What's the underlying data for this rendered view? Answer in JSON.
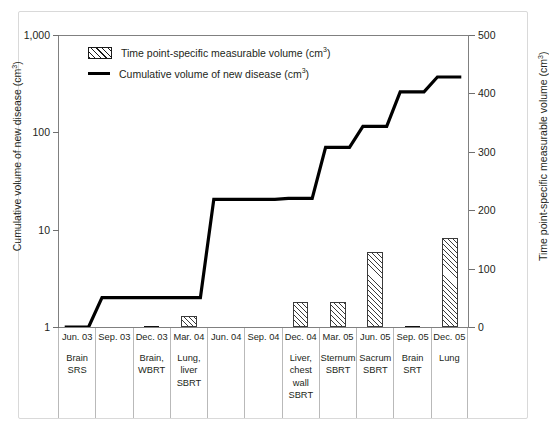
{
  "figure": {
    "legend": [
      {
        "key": "bar",
        "label": "Time point-specific measurable volume (cm",
        "sup": "3",
        "tail": ")"
      },
      {
        "key": "line",
        "label": "Cumulative volume of new disease (cm",
        "sup": "3",
        "tail": ")"
      }
    ],
    "left_axis_title": "Cumulative volume of new disease (cm",
    "left_axis_title_sup": "3",
    "left_axis_title_tail": ")",
    "right_axis_title": "Time point-specific measurable volume (cm",
    "right_axis_title_sup": "3",
    "right_axis_title_tail": ")",
    "left_ticks": [
      "1,000",
      "100",
      "10",
      "1"
    ],
    "right_ticks": [
      "500",
      "400",
      "300",
      "200",
      "100",
      "0"
    ]
  },
  "chart_data": {
    "type": "bar",
    "title": "",
    "xlabel": "",
    "ylabel": "Cumulative volume of new disease (cm3)",
    "y2label": "Time point-specific measurable volume (cm3)",
    "yscale": "log",
    "ylim": [
      1,
      1000
    ],
    "y2lim": [
      0,
      500
    ],
    "grid": false,
    "legend_position": "top-left",
    "categories": [
      "Jun. 03",
      "Sep. 03",
      "Dec. 03",
      "Mar. 04",
      "Jun. 04",
      "Sep. 04",
      "Dec. 04",
      "Mar. 05",
      "Jun. 05",
      "Sep. 05",
      "Dec. 05"
    ],
    "category_labels": [
      {
        "date": "Jun. 03",
        "site": "Brain\nSRS"
      },
      {
        "date": "Sep. 03",
        "site": ""
      },
      {
        "date": "Dec. 03",
        "site": "Brain,\nWBRT"
      },
      {
        "date": "Mar. 04",
        "site": "Lung,\nliver\nSBRT"
      },
      {
        "date": "Jun. 04",
        "site": ""
      },
      {
        "date": "Sep. 04",
        "site": ""
      },
      {
        "date": "Dec. 04",
        "site": "Liver,\nchest\nwall\nSBRT"
      },
      {
        "date": "Mar. 05",
        "site": "Sternum\nSBRT"
      },
      {
        "date": "Jun. 05",
        "site": "Sacrum\nSBRT"
      },
      {
        "date": "Sep. 05",
        "site": "Brain\nSRT"
      },
      {
        "date": "Dec. 05",
        "site": "Lung"
      }
    ],
    "series": [
      {
        "name": "Time point-specific measurable volume (cm3)",
        "axis": "right",
        "type": "bar",
        "values": [
          0.5,
          0,
          1.5,
          19,
          0,
          0,
          43,
          43,
          128,
          1.5,
          152
        ]
      },
      {
        "name": "Cumulative volume of new disease (cm3)",
        "axis": "left",
        "type": "line",
        "values": [
          1,
          2,
          2,
          6,
          20,
          20,
          20,
          70,
          115,
          260,
          370
        ],
        "step_values": [
          1,
          2,
          2,
          null,
          20,
          20,
          20,
          null,
          null,
          null,
          370
        ]
      }
    ],
    "line_points": [
      {
        "x": 0,
        "y": 1.0
      },
      {
        "x": 1,
        "y": 2.0
      },
      {
        "x": 2,
        "y": 2.0
      },
      {
        "x": 3,
        "y": 2.0
      },
      {
        "x": 4,
        "y": 20.5
      },
      {
        "x": 5,
        "y": 20.5
      },
      {
        "x": 6,
        "y": 21.0
      },
      {
        "x": 7,
        "y": 70.0
      },
      {
        "x": 8,
        "y": 115.0
      },
      {
        "x": 9,
        "y": 260.0
      },
      {
        "x": 10,
        "y": 370.0
      }
    ]
  }
}
